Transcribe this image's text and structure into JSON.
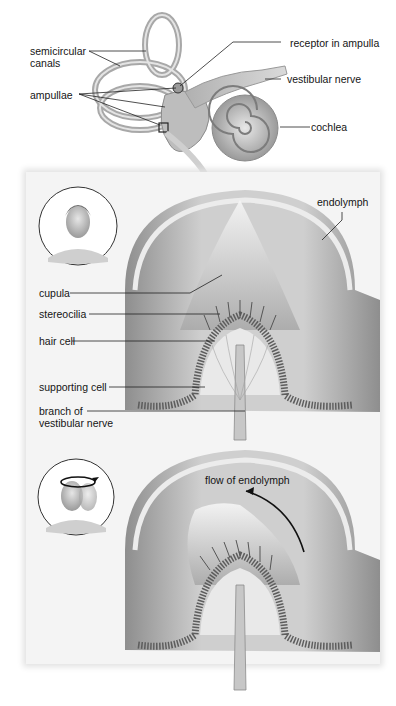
{
  "diagram": {
    "top_figure": {
      "labels": {
        "semicircular_canals": "semicircular\ncanals",
        "semicircular_canals_line1": "semicircular",
        "semicircular_canals_line2": "canals",
        "ampullae": "ampullae",
        "receptor_in_ampulla": "receptor in ampulla",
        "vestibular_nerve": "vestibular nerve",
        "cochlea": "cochlea"
      }
    },
    "middle_panel": {
      "state": "head at rest",
      "labels": {
        "endolymph": "endolymph",
        "cupula": "cupula",
        "stereocilia": "stereocilia",
        "hair_cell": "hair cell",
        "supporting_cell": "supporting cell",
        "branch_line1": "branch of",
        "branch_line2": "vestibular nerve"
      }
    },
    "bottom_panel": {
      "state": "head rotating",
      "labels": {
        "flow_of_endolymph": "flow of endolymph"
      }
    },
    "colors": {
      "panel_bg": "#f4f4f4",
      "tissue_dark": "#8a8a8a",
      "tissue_light": "#d6d6d6",
      "leader_line": "#222222"
    }
  }
}
